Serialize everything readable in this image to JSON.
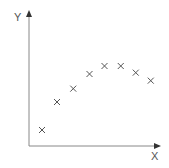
{
  "chart_data": {
    "type": "scatter",
    "title": "",
    "xlabel": "X",
    "ylabel": "Y",
    "grid": false,
    "legend": null,
    "ticks": false,
    "marker": "x",
    "axis_color": "#888888",
    "marker_color": "#555555",
    "xlim": [
      0,
      10
    ],
    "ylim": [
      0,
      10
    ],
    "points": [
      {
        "x": 1,
        "y": 1.2
      },
      {
        "x": 2.2,
        "y": 3.3
      },
      {
        "x": 3.5,
        "y": 4.3
      },
      {
        "x": 4.8,
        "y": 5.4
      },
      {
        "x": 6.0,
        "y": 6.0
      },
      {
        "x": 7.3,
        "y": 6.0
      },
      {
        "x": 8.5,
        "y": 5.5
      },
      {
        "x": 9.7,
        "y": 4.9
      }
    ]
  },
  "labels": {
    "x": "X",
    "y": "Y"
  }
}
